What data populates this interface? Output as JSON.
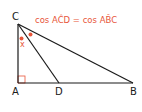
{
  "diagram": {
    "equation": {
      "text": "cos ACD = cos ABC",
      "left": "cos AĈD",
      "equals": "=",
      "right": "cos AB̂C",
      "color": "#e8563a"
    },
    "vertices": {
      "A": {
        "label": "A",
        "x": 18,
        "y": 83
      },
      "B": {
        "label": "B",
        "x": 133,
        "y": 83
      },
      "C": {
        "label": "C",
        "x": 18,
        "y": 24
      },
      "D": {
        "label": "D",
        "x": 59,
        "y": 83
      }
    },
    "angle_label": "x",
    "right_angle_at": "A",
    "colors": {
      "line": "#1a1a1a",
      "accent": "#e8563a",
      "right_angle_marker": "#e8563a"
    }
  }
}
